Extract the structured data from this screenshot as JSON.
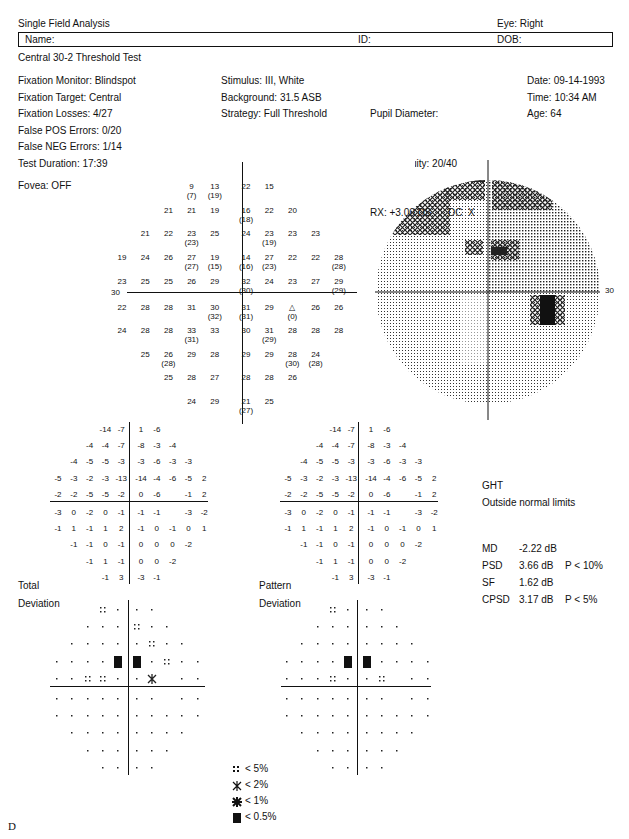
{
  "header": {
    "title": "Single Field Analysis",
    "eye": "Eye: Right",
    "name_label": "Name:",
    "id_label": "ID:",
    "dob_label": "DOB:",
    "test_name": "Central 30-2 Threshold Test"
  },
  "info": {
    "col1": [
      "Fixation Monitor: Blindspot",
      "Fixation Target: Central",
      "Fixation Losses: 4/27",
      "False POS Errors: 0/20",
      "False NEG Errors: 1/14",
      "Test Duration: 17:39"
    ],
    "fovea": "Fovea: OFF",
    "col2": [
      "Stimulus: III, White",
      "Background: 31.5 ASB",
      "Strategy: Full Threshold"
    ],
    "col3": [
      "Pupil Diameter:",
      "Visual Acuity: 20/40",
      "RX: +3.00 DS      DC  X"
    ],
    "col4": [
      "Date: 09-14-1993",
      "Time: 10:34 AM",
      "Age: 64"
    ]
  },
  "axis_labels": {
    "left_30": "30",
    "right_30": "30"
  },
  "stats": {
    "ght_label": "GHT",
    "ght_value": "Outside normal limits",
    "rows": [
      {
        "label": "MD",
        "value": "-2.22 dB",
        "p": ""
      },
      {
        "label": "PSD",
        "value": "3.66 dB",
        "p": "P < 10%"
      },
      {
        "label": "SF",
        "value": "1.62 dB",
        "p": ""
      },
      {
        "label": "CPSD",
        "value": "3.17 dB",
        "p": "P < 5%"
      }
    ]
  },
  "labels": {
    "total": "Total",
    "total2": "Deviation",
    "pattern": "Pattern",
    "pattern2": "Deviation",
    "figure_letter": "D"
  },
  "legend": [
    {
      "symbol": "dots",
      "label": "< 5%"
    },
    {
      "symbol": "light-hatch",
      "label": "< 2%"
    },
    {
      "symbol": "dark-hatch",
      "label": "< 1%"
    },
    {
      "symbol": "solid",
      "label": "< 0.5%"
    }
  ],
  "chart_data": [
    {
      "type": "table",
      "title": "Threshold values (dB), Central 30-2, right eye",
      "note": "values in parentheses are repeat measurements; △ marks blind spot",
      "rows": [
        [
          "",
          "",
          "",
          "9 (7)",
          "13 (19)",
          "22",
          "15",
          "",
          "",
          ""
        ],
        [
          "",
          "",
          "21",
          "21",
          "19",
          "16 (18)",
          "22",
          "20",
          "",
          ""
        ],
        [
          "",
          "21",
          "22",
          "23 (23)",
          "25",
          "24",
          "23 (19)",
          "23",
          "23",
          ""
        ],
        [
          "19",
          "24",
          "26",
          "27 (27)",
          "19 (15)",
          "14 (16)",
          "27 (23)",
          "22",
          "22",
          "28 (28)"
        ],
        [
          "23",
          "25",
          "25",
          "26",
          "29",
          "32 (30)",
          "24",
          "23",
          "27",
          "29 (29)"
        ],
        [
          "22",
          "28",
          "28",
          "31",
          "30 (32)",
          "31 (31)",
          "29",
          "△ (0)",
          "26",
          "26"
        ],
        [
          "24",
          "28",
          "28",
          "33 (31)",
          "33",
          "30",
          "31 (29)",
          "28",
          "28",
          "28"
        ],
        [
          "",
          "25",
          "26 (28)",
          "29",
          "28",
          "29",
          "29",
          "28 (30)",
          "24 (28)",
          ""
        ],
        [
          "",
          "",
          "25",
          "28",
          "27",
          "28",
          "28",
          "26",
          "",
          ""
        ],
        [
          "",
          "",
          "",
          "24",
          "29",
          "21 (27)",
          "25",
          "",
          "",
          ""
        ]
      ]
    },
    {
      "type": "table",
      "title": "Total Deviation (dB)",
      "rows": [
        [
          "",
          "",
          "",
          "-14",
          "-7",
          "1",
          "-6",
          "",
          "",
          ""
        ],
        [
          "",
          "",
          "-4",
          "-4",
          "-7",
          "-8",
          "-3",
          "-4",
          "",
          ""
        ],
        [
          "",
          "-4",
          "-5",
          "-5",
          "-3",
          "-3",
          "-6",
          "-3",
          "-3",
          ""
        ],
        [
          "-5",
          "-3",
          "-2",
          "-3",
          "-13",
          "-14",
          "-4",
          "-6",
          "-5",
          "2"
        ],
        [
          "-2",
          "-2",
          "-5",
          "-5",
          "-2",
          "0",
          "-6",
          "",
          "-1",
          "2"
        ],
        [
          "-3",
          "0",
          "-2",
          "0",
          "-1",
          "-1",
          "-1",
          "",
          "-3",
          "-2"
        ],
        [
          "-1",
          "1",
          "-1",
          "1",
          "2",
          "-1",
          "0",
          "-1",
          "0",
          "1"
        ],
        [
          "",
          "-1",
          "-1",
          "0",
          "-1",
          "0",
          "0",
          "0",
          "-2",
          ""
        ],
        [
          "",
          "",
          "-1",
          "1",
          "-1",
          "0",
          "0",
          "-2",
          "",
          ""
        ],
        [
          "",
          "",
          "",
          "-1",
          "3",
          "-3",
          "-1",
          "",
          "",
          ""
        ]
      ]
    },
    {
      "type": "table",
      "title": "Pattern Deviation (dB)",
      "rows": [
        [
          "",
          "",
          "",
          "-14",
          "-7",
          "1",
          "-6",
          "",
          "",
          ""
        ],
        [
          "",
          "",
          "-4",
          "-4",
          "-7",
          "-8",
          "-3",
          "-4",
          "",
          ""
        ],
        [
          "",
          "-4",
          "-5",
          "-5",
          "-3",
          "-3",
          "-6",
          "-3",
          "-3",
          ""
        ],
        [
          "-5",
          "-3",
          "-2",
          "-3",
          "-13",
          "-14",
          "-4",
          "-6",
          "-5",
          "2"
        ],
        [
          "-2",
          "-2",
          "-5",
          "-5",
          "-2",
          "0",
          "-6",
          "",
          "-1",
          "2"
        ],
        [
          "-3",
          "0",
          "-2",
          "0",
          "-1",
          "-1",
          "-1",
          "",
          "-3",
          "-2"
        ],
        [
          "-1",
          "1",
          "-1",
          "1",
          "2",
          "-1",
          "0",
          "-1",
          "0",
          "1"
        ],
        [
          "",
          "-1",
          "-1",
          "0",
          "-1",
          "0",
          "0",
          "0",
          "-2",
          ""
        ],
        [
          "",
          "",
          "-1",
          "1",
          "-1",
          "0",
          "0",
          "-2",
          "",
          ""
        ],
        [
          "",
          "",
          "",
          "-1",
          "3",
          "-3",
          "-1",
          "",
          "",
          ""
        ]
      ]
    },
    {
      "type": "heatmap",
      "title": "Total Deviation probability map",
      "legend": {
        "d": ". normal",
        "p5": ":: < 5%",
        "p2": "< 2%",
        "p1": "< 1%",
        "p05": "■ < 0.5%"
      },
      "rows": [
        [
          "",
          "",
          "",
          "p5",
          "d",
          "d",
          "d",
          "",
          "",
          ""
        ],
        [
          "",
          "",
          "d",
          "d",
          "d",
          "p5",
          "d",
          "d",
          "",
          ""
        ],
        [
          "",
          "d",
          "d",
          "d",
          "d",
          "d",
          "p5",
          "d",
          "d",
          ""
        ],
        [
          "d",
          "d",
          "d",
          "d",
          "p05",
          "p05",
          "d",
          "p5",
          "d",
          "d"
        ],
        [
          "d",
          "d",
          "p5",
          "p5",
          "d",
          "d",
          "p2",
          "",
          "d",
          "d"
        ],
        [
          "d",
          "d",
          "d",
          "d",
          "d",
          "d",
          "d",
          "",
          "d",
          "d"
        ],
        [
          "d",
          "d",
          "d",
          "d",
          "d",
          "d",
          "d",
          "d",
          "d",
          "d"
        ],
        [
          "",
          "d",
          "d",
          "d",
          "d",
          "d",
          "d",
          "d",
          "d",
          ""
        ],
        [
          "",
          "",
          "d",
          "d",
          "d",
          "d",
          "d",
          "d",
          "",
          ""
        ],
        [
          "",
          "",
          "",
          "d",
          "d",
          "d",
          "d",
          "",
          "",
          ""
        ]
      ]
    },
    {
      "type": "heatmap",
      "title": "Pattern Deviation probability map",
      "rows": [
        [
          "",
          "",
          "",
          "p5",
          "d",
          "d",
          "d",
          "",
          "",
          ""
        ],
        [
          "",
          "",
          "d",
          "d",
          "d",
          "d",
          "d",
          "d",
          "",
          ""
        ],
        [
          "",
          "d",
          "d",
          "d",
          "d",
          "d",
          "d",
          "d",
          "d",
          ""
        ],
        [
          "d",
          "d",
          "d",
          "d",
          "p05",
          "p05",
          "d",
          "d",
          "d",
          "d"
        ],
        [
          "d",
          "d",
          "d",
          "p5",
          "d",
          "d",
          "p5",
          "",
          "d",
          "d"
        ],
        [
          "d",
          "d",
          "d",
          "d",
          "d",
          "d",
          "d",
          "",
          "d",
          "d"
        ],
        [
          "d",
          "d",
          "d",
          "d",
          "d",
          "d",
          "d",
          "d",
          "d",
          "d"
        ],
        [
          "",
          "d",
          "d",
          "d",
          "d",
          "d",
          "d",
          "d",
          "d",
          ""
        ],
        [
          "",
          "",
          "d",
          "d",
          "d",
          "d",
          "d",
          "d",
          "",
          ""
        ],
        [
          "",
          "",
          "",
          "d",
          "d",
          "d",
          "d",
          "",
          "",
          ""
        ]
      ]
    },
    {
      "type": "heatmap",
      "title": "Grayscale",
      "xlabel": "30",
      "xlim": [
        -30,
        30
      ],
      "ylim": [
        -30,
        30
      ]
    }
  ]
}
